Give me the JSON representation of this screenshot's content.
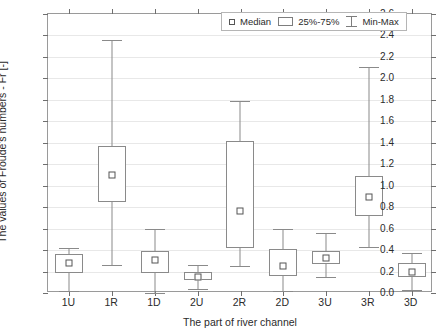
{
  "chart_data": {
    "type": "box",
    "title": "",
    "xlabel": "The part of river channel",
    "ylabel": "The values of Froude's numbers - Fr [-]",
    "ylim": [
      0.0,
      2.6
    ],
    "ytick_step": 0.2,
    "yticks": [
      "0.0",
      "0.2",
      "0.4",
      "0.6",
      "0.8",
      "1.0",
      "1.2",
      "1.4",
      "1.6",
      "1.8",
      "2.0",
      "2.2",
      "2.4",
      "2.6"
    ],
    "categories": [
      "1U",
      "1R",
      "1D",
      "2U",
      "2R",
      "2D",
      "3U",
      "3R",
      "3D"
    ],
    "grid": true,
    "legend_position": "top-right",
    "legend": [
      {
        "key": "median",
        "label": "Median"
      },
      {
        "key": "quartiles",
        "label": "25%-75%"
      },
      {
        "key": "minmax",
        "label": "Min-Max"
      }
    ],
    "boxes": [
      {
        "category": "1U",
        "min": 0.02,
        "q1": 0.19,
        "median": 0.28,
        "q3": 0.36,
        "max": 0.42
      },
      {
        "category": "1R",
        "min": 0.26,
        "q1": 0.85,
        "median": 1.1,
        "q3": 1.37,
        "max": 2.36
      },
      {
        "category": "1D",
        "min": 0.0,
        "q1": 0.19,
        "median": 0.31,
        "q3": 0.39,
        "max": 0.6
      },
      {
        "category": "2U",
        "min": 0.04,
        "q1": 0.12,
        "median": 0.15,
        "q3": 0.2,
        "max": 0.26
      },
      {
        "category": "2R",
        "min": 0.25,
        "q1": 0.42,
        "median": 0.76,
        "q3": 1.42,
        "max": 1.79
      },
      {
        "category": "2D",
        "min": 0.02,
        "q1": 0.16,
        "median": 0.25,
        "q3": 0.41,
        "max": 0.6
      },
      {
        "category": "3U",
        "min": 0.15,
        "q1": 0.27,
        "median": 0.33,
        "q3": 0.39,
        "max": 0.56
      },
      {
        "category": "3R",
        "min": 0.43,
        "q1": 0.72,
        "median": 0.89,
        "q3": 1.09,
        "max": 2.11
      },
      {
        "category": "3D",
        "min": 0.03,
        "q1": 0.15,
        "median": 0.2,
        "q3": 0.28,
        "max": 0.37
      }
    ]
  }
}
